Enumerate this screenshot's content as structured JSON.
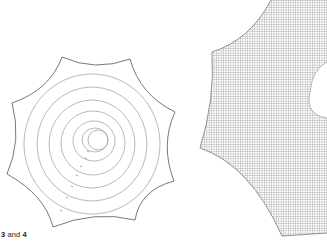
{
  "caption": {
    "num_a": "3",
    "joiner": " and ",
    "num_b": "4"
  },
  "figure_3": {
    "description": "octagonal web outline with concentric spiral rings",
    "stroke_outline": "#555555",
    "stroke_rings": "#9a9a9a",
    "ring_count": 6
  },
  "figure_4": {
    "description": "cross-hatched grid fill inside curved web outline",
    "grid_color": "#8a8a8a",
    "outline_color": "#666666"
  }
}
